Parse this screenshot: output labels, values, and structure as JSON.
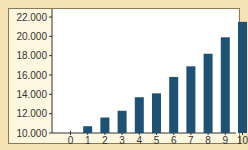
{
  "chart_data": {
    "type": "bar",
    "title": "",
    "xlabel": "",
    "ylabel": "",
    "categories": [
      "1",
      "2",
      "3",
      "4",
      "5",
      "6",
      "7",
      "8",
      "9",
      "10"
    ],
    "x_ticks": [
      "0",
      "1",
      "2",
      "3",
      "4",
      "5",
      "6",
      "7",
      "8",
      "9",
      "10"
    ],
    "y_ticks": [
      "10.000",
      "12.000",
      "14.000",
      "16.000",
      "18.000",
      "20.000",
      "22.000"
    ],
    "values": [
      10700,
      11600,
      12300,
      13700,
      14100,
      15800,
      16900,
      18200,
      19900,
      21500
    ],
    "ylim": [
      10000,
      22000
    ],
    "xlim": [
      0,
      10
    ],
    "grid": false,
    "legend": null,
    "bar_color": "#1d5275",
    "background_color": "#f6e3b4"
  }
}
